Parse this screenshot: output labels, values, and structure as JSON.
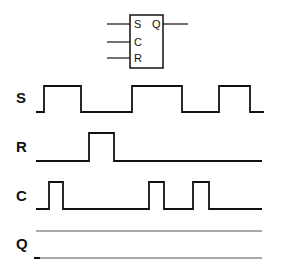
{
  "flipflop": {
    "inputs": [
      "S",
      "C",
      "R"
    ],
    "output": "Q"
  },
  "signals": [
    {
      "label": "S",
      "points": "36,112 44,112 44,86 81,86 81,112 132,112 132,86 182,86 182,112 219,112 219,86 250,86 250,112 264,112"
    },
    {
      "label": "R",
      "points": "36,161 89,161 89,133 114,133 114,161 262,161"
    },
    {
      "label": "C",
      "points": "36,209 49,209 49,182 63,182 63,209 149,209 149,182 164,182 164,209 193,209 193,182 209,182 209,209 262,209"
    },
    {
      "label": "Q",
      "points": ""
    }
  ],
  "colors": {
    "line": "#111111",
    "background": "#ffffff"
  }
}
